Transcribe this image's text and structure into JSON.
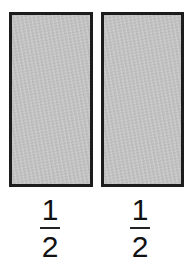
{
  "diagram": {
    "parts": [
      {
        "label": {
          "numerator": "1",
          "denominator": "2"
        },
        "fill": "#c5c5c5",
        "border": "#1c1c1c"
      },
      {
        "label": {
          "numerator": "1",
          "denominator": "2"
        },
        "fill": "#c5c5c5",
        "border": "#1c1c1c"
      }
    ]
  }
}
